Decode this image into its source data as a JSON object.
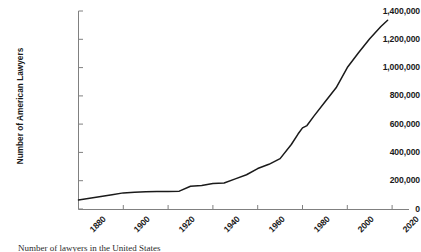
{
  "chart_data": {
    "type": "line",
    "title": "",
    "xlabel": "",
    "ylabel": "Number of American Lawyers",
    "xlim": [
      1880,
      2020
    ],
    "ylim": [
      0,
      1400000
    ],
    "grid": false,
    "legend": null,
    "x_ticks": [
      "1880",
      "1900",
      "1920",
      "1940",
      "1960",
      "1980",
      "2000",
      "2020"
    ],
    "x_tick_values": [
      1880,
      1900,
      1920,
      1940,
      1960,
      1980,
      2000,
      2020
    ],
    "y_ticks": [
      "0",
      "200,000",
      "400,000",
      "600,000",
      "800,000",
      "1,000,000",
      "1,200,000",
      "1,400,000"
    ],
    "y_tick_values": [
      0,
      200000,
      400000,
      600000,
      800000,
      1000000,
      1200000,
      1400000
    ],
    "line_color": "#1a1a1a",
    "axis_color": "#808080",
    "series": [
      {
        "name": "Number of American Lawyers",
        "x": [
          1880,
          1885,
          1890,
          1895,
          1900,
          1905,
          1910,
          1915,
          1920,
          1925,
          1930,
          1935,
          1940,
          1945,
          1950,
          1955,
          1960,
          1965,
          1970,
          1975,
          1978,
          1980,
          1982,
          1985,
          1990,
          1995,
          2000,
          2005,
          2010,
          2015,
          2018
        ],
        "values": [
          64000,
          76000,
          89000,
          101000,
          114000,
          119000,
          122000,
          123000,
          123000,
          126000,
          161000,
          166000,
          180000,
          184000,
          213000,
          242000,
          286000,
          316000,
          356000,
          456000,
          530000,
          574000,
          590000,
          655000,
          756000,
          857000,
          1000000,
          1105000,
          1204000,
          1290000,
          1335000
        ]
      }
    ],
    "annotations": []
  },
  "caption": {
    "text": "Number of lawyers in the United States"
  }
}
